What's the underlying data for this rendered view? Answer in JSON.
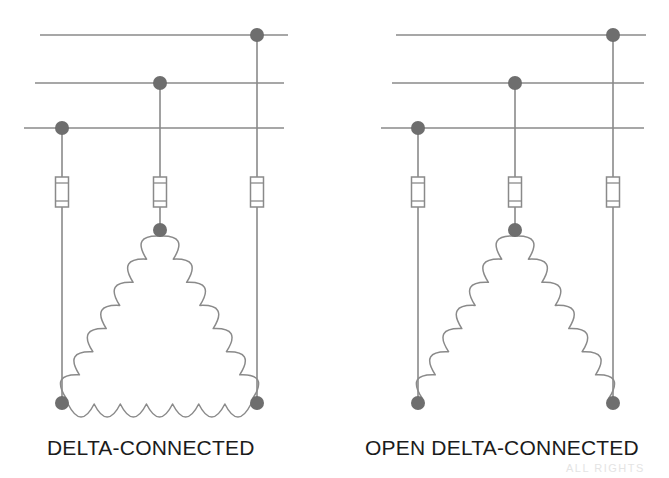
{
  "figure": {
    "type": "electrical-schematic",
    "background_color": "#ffffff",
    "line_color": "#8a8a8a",
    "node_color": "#6e6e6e",
    "label_color": "#1b1b1b"
  },
  "watermark": {
    "text": "ALL RIGHTS"
  },
  "diagrams": [
    {
      "id": "delta",
      "label": "DELTA-CONNECTED",
      "label_x": 47,
      "label_y": 436,
      "closed": true,
      "bus_lines": [
        {
          "name": "phase-a-bus",
          "x1": 40,
          "x2": 288,
          "y": 35
        },
        {
          "name": "phase-b-bus",
          "x1": 35,
          "x2": 284,
          "y": 83
        },
        {
          "name": "phase-c-bus",
          "x1": 24,
          "x2": 284,
          "y": 128
        }
      ],
      "bus_nodes": [
        {
          "name": "bus-node-phase-c",
          "x": 62,
          "y": 128
        },
        {
          "name": "bus-node-phase-b",
          "x": 160,
          "y": 83
        },
        {
          "name": "bus-node-phase-a",
          "x": 257,
          "y": 35
        }
      ],
      "drop_leads": [
        {
          "name": "drop-lead-left",
          "x": 62,
          "y1": 128,
          "y2": 177
        },
        {
          "name": "drop-lead-center",
          "x": 160,
          "y1": 83,
          "y2": 177
        },
        {
          "name": "drop-lead-right",
          "x": 257,
          "y1": 35,
          "y2": 177
        }
      ],
      "fuses": [
        {
          "name": "fuse-left",
          "x": 62,
          "y_top": 177,
          "y_bottom": 207
        },
        {
          "name": "fuse-center",
          "x": 160,
          "y_top": 177,
          "y_bottom": 207
        },
        {
          "name": "fuse-right",
          "x": 257,
          "y_top": 177,
          "y_bottom": 207
        }
      ],
      "lower_leads": [
        {
          "name": "lower-lead-left",
          "x": 62,
          "y1": 207,
          "y2": 403
        },
        {
          "name": "lower-lead-center",
          "x": 160,
          "y1": 207,
          "y2": 230
        },
        {
          "name": "lower-lead-right",
          "x": 257,
          "y1": 207,
          "y2": 403
        }
      ],
      "winding_nodes": [
        {
          "name": "winding-node-apex",
          "x": 160,
          "y": 230
        },
        {
          "name": "winding-node-bottom-left",
          "x": 62,
          "y": 403
        },
        {
          "name": "winding-node-bottom-right",
          "x": 257,
          "y": 403
        }
      ],
      "windings": [
        {
          "name": "winding-left-leg",
          "from_x": 160,
          "from_y": 236,
          "to_x": 66,
          "to_y": 398,
          "coils": 7,
          "amplitude": 13,
          "side": "outer"
        },
        {
          "name": "winding-right-leg",
          "from_x": 160,
          "from_y": 236,
          "to_x": 253,
          "to_y": 398,
          "coils": 7,
          "amplitude": 13,
          "side": "outer"
        },
        {
          "name": "winding-bottom",
          "from_x": 68,
          "from_y": 404,
          "to_x": 251,
          "to_y": 404,
          "coils": 7,
          "amplitude": 13,
          "side": "outer"
        }
      ]
    },
    {
      "id": "open-delta",
      "label": "OPEN DELTA-CONNECTED",
      "label_x": 365,
      "label_y": 436,
      "closed": false,
      "bus_lines": [
        {
          "name": "phase-a-bus",
          "x1": 396,
          "x2": 646,
          "y": 35
        },
        {
          "name": "phase-b-bus",
          "x1": 392,
          "x2": 644,
          "y": 83
        },
        {
          "name": "phase-c-bus",
          "x1": 381,
          "x2": 644,
          "y": 128
        }
      ],
      "bus_nodes": [
        {
          "name": "bus-node-phase-c",
          "x": 418,
          "y": 128
        },
        {
          "name": "bus-node-phase-b",
          "x": 515,
          "y": 83
        },
        {
          "name": "bus-node-phase-a",
          "x": 613,
          "y": 35
        }
      ],
      "drop_leads": [
        {
          "name": "drop-lead-left",
          "x": 418,
          "y1": 128,
          "y2": 177
        },
        {
          "name": "drop-lead-center",
          "x": 515,
          "y1": 83,
          "y2": 177
        },
        {
          "name": "drop-lead-right",
          "x": 613,
          "y1": 35,
          "y2": 177
        }
      ],
      "fuses": [
        {
          "name": "fuse-left",
          "x": 418,
          "y_top": 177,
          "y_bottom": 207
        },
        {
          "name": "fuse-center",
          "x": 515,
          "y_top": 177,
          "y_bottom": 207
        },
        {
          "name": "fuse-right",
          "x": 613,
          "y_top": 177,
          "y_bottom": 207
        }
      ],
      "lower_leads": [
        {
          "name": "lower-lead-left",
          "x": 418,
          "y1": 207,
          "y2": 403
        },
        {
          "name": "lower-lead-center",
          "x": 515,
          "y1": 207,
          "y2": 230
        },
        {
          "name": "lower-lead-right",
          "x": 613,
          "y1": 207,
          "y2": 403
        }
      ],
      "winding_nodes": [
        {
          "name": "winding-node-apex",
          "x": 515,
          "y": 230
        },
        {
          "name": "winding-node-bottom-left",
          "x": 418,
          "y": 403
        },
        {
          "name": "winding-node-bottom-right",
          "x": 613,
          "y": 403
        }
      ],
      "windings": [
        {
          "name": "winding-left-leg",
          "from_x": 515,
          "from_y": 236,
          "to_x": 422,
          "to_y": 398,
          "coils": 7,
          "amplitude": 13,
          "side": "outer"
        },
        {
          "name": "winding-right-leg",
          "from_x": 515,
          "from_y": 236,
          "to_x": 609,
          "to_y": 398,
          "coils": 7,
          "amplitude": 13,
          "side": "outer"
        }
      ]
    }
  ]
}
